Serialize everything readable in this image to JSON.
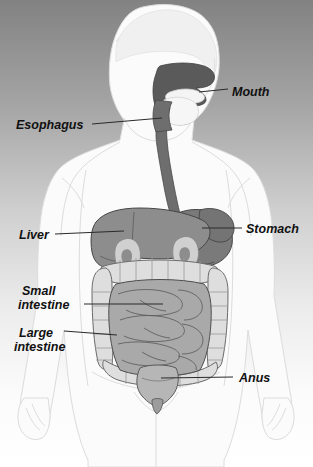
{
  "diagram": {
    "background": {
      "type": "vertical-gradient",
      "top_color": "#848484",
      "mid_color": "#c8c8c8",
      "bottom_color": "#ffffff"
    },
    "palette": {
      "body_fill": "#fcfcfc",
      "body_outline": "#d8d8d8",
      "head_fill": "#f2f2f2",
      "oral_cavity": "#555555",
      "esophagus": "#6e6e6e",
      "liver": "#8d8d8d",
      "stomach": "#787878",
      "kidney": "#cfcfcf",
      "small_intestine": "#a8a8a8",
      "large_intestine": "#dcdcdc",
      "rectum": "#b4b4b4",
      "organ_outline": "#4a4a4a",
      "leader_line": "#2a2a2a",
      "label_text": "#111111"
    },
    "labels": [
      {
        "id": "mouth",
        "text": "Mouth",
        "side": "right",
        "text_x": 232,
        "text_y": 95,
        "leader": {
          "x1": 202,
          "y1": 91,
          "x2": 226,
          "y2": 91
        }
      },
      {
        "id": "esophagus",
        "text": "Esophagus",
        "side": "left",
        "text_x": 16,
        "text_y": 128,
        "leader": {
          "x1": 95,
          "y1": 124,
          "x2": 160,
          "y2": 120
        }
      },
      {
        "id": "liver",
        "text": "Liver",
        "side": "left",
        "text_x": 18,
        "text_y": 238,
        "leader": {
          "x1": 56,
          "y1": 234,
          "x2": 123,
          "y2": 231
        }
      },
      {
        "id": "stomach",
        "text": "Stomach",
        "side": "right",
        "text_x": 245,
        "text_y": 232,
        "leader": {
          "x1": 203,
          "y1": 228,
          "x2": 240,
          "y2": 228
        }
      },
      {
        "id": "small-intestine",
        "line1": "Small",
        "line2": "intestine",
        "text": "Small intestine",
        "side": "left",
        "text_x": 20,
        "text_y": 292,
        "leader": {
          "x1": 86,
          "y1": 304,
          "x2": 160,
          "y2": 304
        }
      },
      {
        "id": "large-intestine",
        "line1": "Large",
        "line2": "intestine",
        "text": "Large intestine",
        "side": "left",
        "text_x": 18,
        "text_y": 334,
        "leader": {
          "x1": 66,
          "y1": 331,
          "x2": 118,
          "y2": 334
        }
      },
      {
        "id": "anus",
        "text": "Anus",
        "side": "right",
        "text_x": 238,
        "text_y": 381,
        "leader": {
          "x1": 163,
          "y1": 377,
          "x2": 233,
          "y2": 377
        }
      }
    ],
    "organs": [
      {
        "id": "mouth",
        "name": "Mouth",
        "region": "head"
      },
      {
        "id": "esophagus",
        "name": "Esophagus",
        "region": "neck-chest"
      },
      {
        "id": "liver",
        "name": "Liver",
        "region": "upper-abdomen-left"
      },
      {
        "id": "stomach",
        "name": "Stomach",
        "region": "upper-abdomen-right"
      },
      {
        "id": "small-intestine",
        "name": "Small intestine",
        "region": "central-abdomen"
      },
      {
        "id": "large-intestine",
        "name": "Large intestine",
        "region": "peripheral-abdomen"
      },
      {
        "id": "anus",
        "name": "Anus",
        "region": "pelvis"
      }
    ]
  }
}
